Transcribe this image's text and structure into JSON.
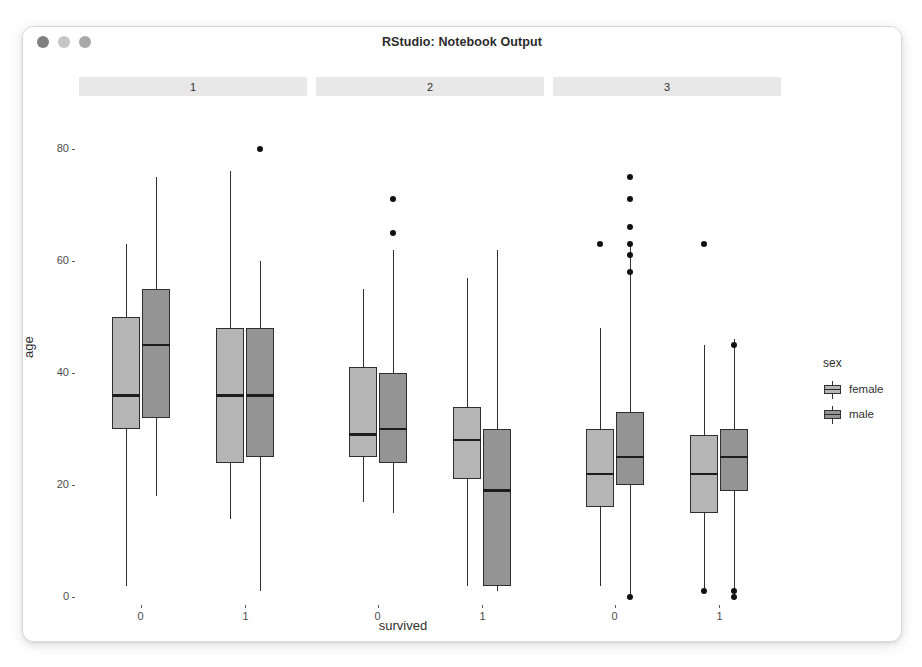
{
  "window": {
    "title": "RStudio: Notebook Output",
    "traffic_lights": [
      {
        "name": "close-button",
        "color": "#808080"
      },
      {
        "name": "minimize-button",
        "color": "#c6c6c6"
      },
      {
        "name": "maximize-button",
        "color": "#a8a8a8"
      }
    ]
  },
  "chart_data": {
    "type": "box",
    "title": "",
    "xlabel": "survived",
    "ylabel": "age",
    "ylim": [
      0,
      82
    ],
    "yticks": [
      0,
      20,
      40,
      60,
      80
    ],
    "grid": false,
    "facet_variable": "pclass",
    "facets": [
      "1",
      "2",
      "3"
    ],
    "categories": [
      "0",
      "1"
    ],
    "legend": {
      "title": "sex",
      "position": "right",
      "entries": [
        {
          "name": "female",
          "color": "#b5b5b5"
        },
        {
          "name": "male",
          "color": "#949494"
        }
      ]
    },
    "series": [
      {
        "name": "female",
        "color": "#b5b5b5",
        "boxes": [
          {
            "facet": "1",
            "x": "0",
            "min": 2,
            "q1": 30,
            "median": 36,
            "q3": 50,
            "max": 63,
            "outliers": []
          },
          {
            "facet": "1",
            "x": "1",
            "min": 14,
            "q1": 24,
            "median": 36,
            "q3": 48,
            "max": 76,
            "outliers": []
          },
          {
            "facet": "2",
            "x": "0",
            "min": 17,
            "q1": 25,
            "median": 29,
            "q3": 41,
            "max": 55,
            "outliers": []
          },
          {
            "facet": "2",
            "x": "1",
            "min": 2,
            "q1": 21,
            "median": 28,
            "q3": 34,
            "max": 57,
            "outliers": []
          },
          {
            "facet": "3",
            "x": "0",
            "min": 2,
            "q1": 16,
            "median": 22,
            "q3": 30,
            "max": 48,
            "outliers": [
              63
            ]
          },
          {
            "facet": "3",
            "x": "1",
            "min": 1,
            "q1": 15,
            "median": 22,
            "q3": 29,
            "max": 45,
            "outliers": [
              63,
              1
            ]
          }
        ]
      },
      {
        "name": "male",
        "color": "#949494",
        "boxes": [
          {
            "facet": "1",
            "x": "0",
            "min": 18,
            "q1": 32,
            "median": 45,
            "q3": 55,
            "max": 75,
            "outliers": []
          },
          {
            "facet": "1",
            "x": "1",
            "min": 1,
            "q1": 25,
            "median": 36,
            "q3": 48,
            "max": 60,
            "outliers": [
              80
            ]
          },
          {
            "facet": "2",
            "x": "0",
            "min": 15,
            "q1": 24,
            "median": 30,
            "q3": 40,
            "max": 62,
            "outliers": [
              71,
              65
            ]
          },
          {
            "facet": "2",
            "x": "1",
            "min": 1,
            "q1": 2,
            "median": 19,
            "q3": 30,
            "max": 62,
            "outliers": []
          },
          {
            "facet": "3",
            "x": "0",
            "min": 0,
            "q1": 20,
            "median": 25,
            "q3": 33,
            "max": 63,
            "outliers": [
              75,
              71,
              66,
              63,
              61,
              58,
              0
            ]
          },
          {
            "facet": "3",
            "x": "1",
            "min": 1,
            "q1": 19,
            "median": 25,
            "q3": 30,
            "max": 46,
            "outliers": [
              45,
              1,
              0
            ]
          }
        ]
      }
    ]
  }
}
